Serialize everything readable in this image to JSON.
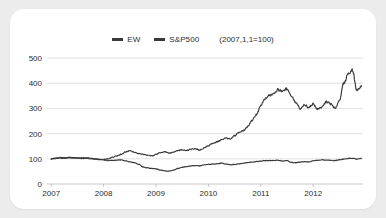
{
  "legend": {
    "entries": [
      {
        "label": "EW",
        "color": "#3a3a3a"
      },
      {
        "label": "S&P500",
        "color": "#3a3a3a"
      }
    ],
    "note": "(2007,1,1=100)"
  },
  "chart_data": {
    "type": "line",
    "title": "",
    "subtitle": "",
    "annotation": "(2007,1,1=100)",
    "xlabel": "",
    "ylabel": "",
    "ylim": [
      0,
      520
    ],
    "xlim": [
      2006.92,
      2012.95
    ],
    "yticks": [
      0,
      100,
      200,
      300,
      400,
      500
    ],
    "ytick_labels": [
      "0",
      "100",
      "200",
      "300",
      "400",
      "500"
    ],
    "xticks": [
      2007,
      2008,
      2009,
      2010,
      2011,
      2012
    ],
    "xtick_labels": [
      "2007",
      "2008",
      "2009",
      "2010",
      "2011",
      "2012"
    ],
    "grid": "horizontal",
    "legend_position": "top-center",
    "normalization_base": 100,
    "normalization_date": "2007-01-01",
    "series": [
      {
        "name": "EW",
        "color": "#3a3a3a",
        "x": [
          2007.0,
          2007.08,
          2007.17,
          2007.25,
          2007.33,
          2007.42,
          2007.5,
          2007.58,
          2007.67,
          2007.75,
          2007.83,
          2007.92,
          2008.0,
          2008.08,
          2008.17,
          2008.25,
          2008.33,
          2008.42,
          2008.5,
          2008.58,
          2008.67,
          2008.75,
          2008.83,
          2008.92,
          2009.0,
          2009.08,
          2009.17,
          2009.25,
          2009.33,
          2009.42,
          2009.5,
          2009.58,
          2009.67,
          2009.75,
          2009.83,
          2009.92,
          2010.0,
          2010.08,
          2010.17,
          2010.25,
          2010.33,
          2010.42,
          2010.5,
          2010.58,
          2010.67,
          2010.75,
          2010.83,
          2010.92,
          2011.0,
          2011.08,
          2011.17,
          2011.25,
          2011.33,
          2011.42,
          2011.5,
          2011.58,
          2011.67,
          2011.75,
          2011.83,
          2011.92,
          2012.0,
          2012.08,
          2012.17,
          2012.25,
          2012.33,
          2012.42,
          2012.5,
          2012.58,
          2012.67,
          2012.75,
          2012.83,
          2012.92
        ],
        "values": [
          100,
          103,
          105,
          104,
          106,
          105,
          104,
          103,
          104,
          102,
          100,
          98,
          97,
          99,
          106,
          112,
          118,
          127,
          133,
          126,
          121,
          118,
          114,
          112,
          117,
          124,
          128,
          122,
          127,
          133,
          136,
          133,
          138,
          140,
          134,
          143,
          152,
          161,
          168,
          175,
          183,
          178,
          192,
          205,
          212,
          228,
          252,
          276,
          310,
          338,
          352,
          362,
          374,
          368,
          378,
          351,
          322,
          298,
          312,
          305,
          318,
          296,
          306,
          327,
          318,
          300,
          332,
          398,
          438,
          452,
          372,
          388
        ]
      },
      {
        "name": "S&P500",
        "color": "#3a3a3a",
        "x": [
          2007.0,
          2007.08,
          2007.17,
          2007.25,
          2007.33,
          2007.42,
          2007.5,
          2007.58,
          2007.67,
          2007.75,
          2007.83,
          2007.92,
          2008.0,
          2008.08,
          2008.17,
          2008.25,
          2008.33,
          2008.42,
          2008.5,
          2008.58,
          2008.67,
          2008.75,
          2008.83,
          2008.92,
          2009.0,
          2009.08,
          2009.17,
          2009.25,
          2009.33,
          2009.42,
          2009.5,
          2009.58,
          2009.67,
          2009.75,
          2009.83,
          2009.92,
          2010.0,
          2010.08,
          2010.17,
          2010.25,
          2010.33,
          2010.42,
          2010.5,
          2010.58,
          2010.67,
          2010.75,
          2010.83,
          2010.92,
          2011.0,
          2011.08,
          2011.17,
          2011.25,
          2011.33,
          2011.42,
          2011.5,
          2011.58,
          2011.67,
          2011.75,
          2011.83,
          2011.92,
          2012.0,
          2012.08,
          2012.17,
          2012.25,
          2012.33,
          2012.42,
          2012.5,
          2012.58,
          2012.67,
          2012.75,
          2012.83,
          2012.92
        ],
        "values": [
          100,
          101,
          103,
          102,
          104,
          103,
          103,
          101,
          102,
          101,
          99,
          97,
          96,
          93,
          94,
          95,
          96,
          92,
          88,
          85,
          78,
          68,
          64,
          62,
          60,
          55,
          52,
          51,
          55,
          62,
          66,
          69,
          72,
          73,
          72,
          76,
          78,
          79,
          80,
          83,
          79,
          76,
          78,
          80,
          83,
          85,
          87,
          89,
          91,
          93,
          93,
          94,
          94,
          91,
          93,
          86,
          84,
          87,
          89,
          88,
          92,
          94,
          96,
          95,
          94,
          93,
          96,
          99,
          101,
          102,
          99,
          101
        ]
      }
    ]
  }
}
